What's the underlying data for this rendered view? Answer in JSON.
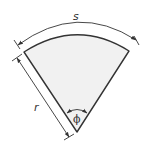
{
  "diagram": {
    "type": "circular-sector",
    "labels": {
      "arc_length": "s",
      "radius": "r",
      "angle": "ϕ"
    },
    "colors": {
      "fill": "#f1f1f1",
      "stroke": "#333333",
      "background": "#ffffff"
    }
  }
}
